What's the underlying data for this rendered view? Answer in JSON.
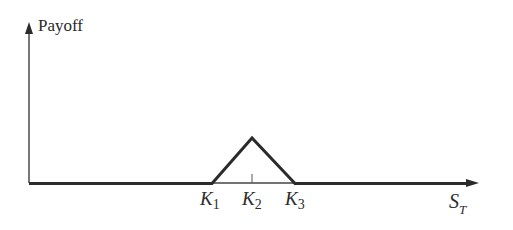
{
  "diagram": {
    "type": "payoff-diagram",
    "y_axis_label": "Payoff",
    "x_axis_label": {
      "base": "S",
      "sub": "T"
    },
    "strikes": [
      {
        "base": "K",
        "sub": "1"
      },
      {
        "base": "K",
        "sub": "2"
      },
      {
        "base": "K",
        "sub": "3"
      }
    ],
    "shape": "triangle payoff peaking at K2, zero below K1 and above K3",
    "colors": {
      "line": "#2b2b2b",
      "background": "#ffffff"
    }
  }
}
